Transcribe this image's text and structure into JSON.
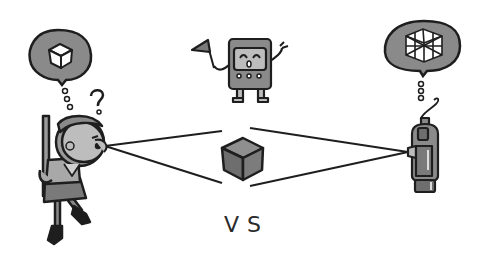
{
  "illustration": {
    "label": "VS",
    "colors": {
      "outline": "#1e1e1e",
      "fill_mid": "#8a8a8a",
      "fill_light": "#bdbdbd",
      "fill_dark": "#5a5a5a",
      "background": "#ffffff"
    },
    "elements": {
      "person": "child looking through eye with sword on back",
      "person_thought": "simple-cube-icon",
      "question": "?",
      "robot": "robot holding flag",
      "camera": "camera device",
      "camera_thought": "mesh-cube-icon",
      "center_object": "cube"
    }
  }
}
